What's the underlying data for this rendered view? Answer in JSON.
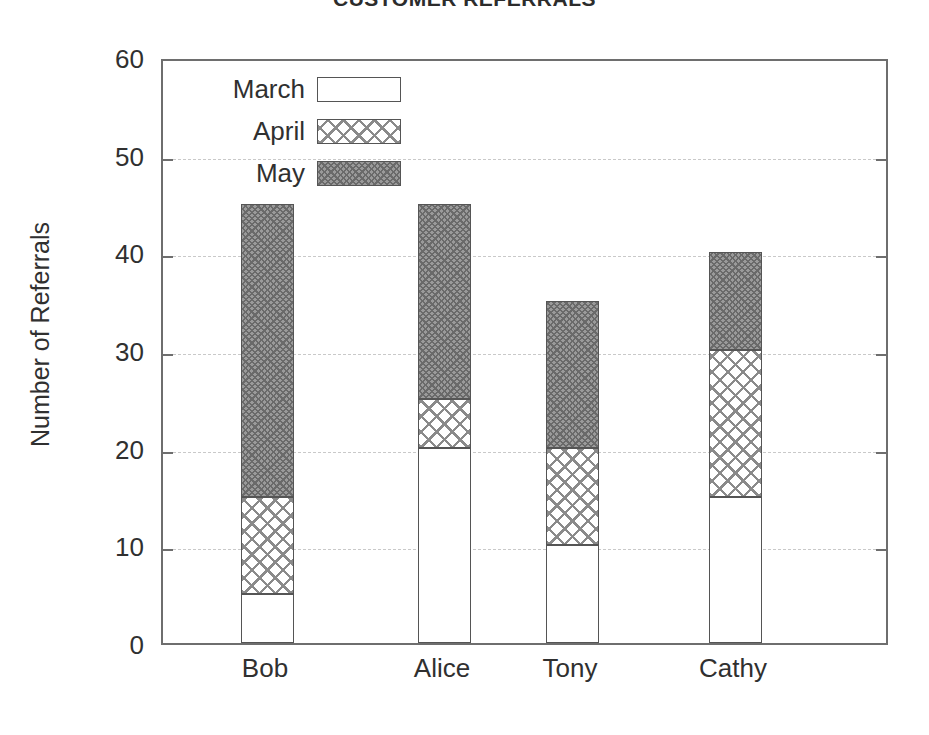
{
  "chart_data": {
    "type": "bar",
    "subtype": "stacked-bar",
    "title": "CUSTOMER REFERRALS",
    "xlabel": "",
    "ylabel": "Number of Referrals",
    "ylim": [
      0,
      60
    ],
    "ytick_step": 10,
    "yticks": [
      0,
      10,
      20,
      30,
      40,
      50,
      60
    ],
    "ytick_labels": [
      "0",
      "10",
      "20",
      "30",
      "40",
      "50",
      "60"
    ],
    "grid": true,
    "grid_style": "dotted-horizontal",
    "legend_position": "top-left-inside",
    "categories": [
      "Bob",
      "Alice",
      "Tony",
      "Cathy"
    ],
    "series": [
      {
        "name": "March",
        "fill": "empty-white",
        "color": "#ffffff",
        "values": [
          5,
          20,
          10,
          15
        ]
      },
      {
        "name": "April",
        "fill": "cross-hatch-open",
        "color": "#8a8a8a",
        "values": [
          10,
          5,
          10,
          15
        ]
      },
      {
        "name": "May",
        "fill": "cross-hatch-dense",
        "color": "#9a9a9a",
        "values": [
          30,
          20,
          15,
          10
        ]
      }
    ],
    "totals": [
      45,
      45,
      35,
      40
    ],
    "cumulative_tops": {
      "Bob": {
        "March": 5,
        "April": 15,
        "May": 45
      },
      "Alice": {
        "March": 20,
        "April": 25,
        "May": 45
      },
      "Tony": {
        "March": 10,
        "April": 20,
        "May": 35
      },
      "Cathy": {
        "March": 15,
        "April": 30,
        "May": 40
      }
    }
  },
  "legend": {
    "items": [
      {
        "label": "March",
        "swatch": "fill-march"
      },
      {
        "label": "April",
        "swatch": "fill-april"
      },
      {
        "label": "May",
        "swatch": "fill-may"
      }
    ]
  },
  "colors": {
    "frame": "#6e6e6e",
    "grid": "#c9c9c9",
    "text": "#303030",
    "background": "#ffffff",
    "march_fill": "#ffffff",
    "april_hatch": "#8a8a8a",
    "may_fill": "#9a9a9a"
  }
}
